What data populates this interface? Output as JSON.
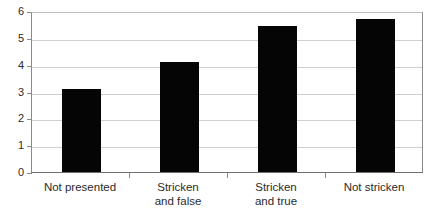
{
  "chart_data": {
    "type": "bar",
    "title": "",
    "subtitle": "",
    "xlabel": "",
    "ylabel": "",
    "categories": [
      "Not presented",
      "Stricken\nand false",
      "Stricken\nand true",
      "Not stricken"
    ],
    "values": [
      3.1,
      4.1,
      5.45,
      5.7
    ],
    "series": [
      {
        "name": "",
        "values": [
          3.1,
          4.1,
          5.45,
          5.7
        ]
      }
    ],
    "ylim": [
      0,
      6
    ],
    "yticks": [
      0,
      1,
      2,
      3,
      4,
      5,
      6
    ],
    "ytick_labels": [
      "0",
      "1",
      "2",
      "3",
      "4",
      "5",
      "6"
    ],
    "grid": true,
    "legend": false,
    "legend_position": "none",
    "bar_color": "#050505",
    "grid_color": "#cfcfcf",
    "axis_color": "#8a8a8a",
    "text_color": "#2b2b2b",
    "background_color": "#ffffff"
  }
}
